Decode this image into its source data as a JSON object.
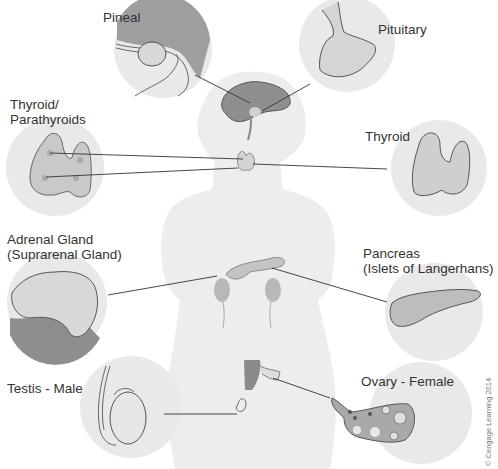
{
  "figure": {
    "type": "endocrine-glands-diagram",
    "colors": {
      "background": "#ffffff",
      "body_silhouette": "#ededed",
      "inset_circle": "#e9e9e9",
      "organ_fill": "#cfcfcf",
      "organ_dark": "#9a9a9a",
      "outline": "#555555",
      "leader_line": "#333333",
      "label_text": "#333333"
    }
  },
  "labels": {
    "pineal": "Pineal",
    "pituitary": "Pituitary",
    "thyroid_parathyroids_line1": "Thyroid/",
    "thyroid_parathyroids_line2": "Parathyroids",
    "thyroid": "Thyroid",
    "adrenal_line1": "Adrenal Gland",
    "adrenal_line2": "(Suprarenal Gland)",
    "pancreas_line1": "Pancreas",
    "pancreas_line2": "(Islets of Langerhans)",
    "testis": "Testis - Male",
    "ovary": "Ovary - Female"
  },
  "credit": "© Cengage Learning 2014"
}
